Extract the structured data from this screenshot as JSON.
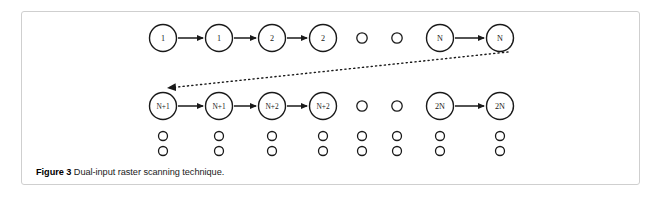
{
  "figure": {
    "caption_label": "Figure 3",
    "caption_text": " Dual-input raster scanning technique.",
    "frame_color": "#cfcfcf",
    "background": "#ffffff",
    "stroke_color": "#1a1a1a"
  },
  "diagram": {
    "type": "flow-diagram",
    "description": "Dual-input raster scanning technique",
    "rows": [
      {
        "id": "row-top",
        "y": 38,
        "node_radius": 13.5,
        "nodes": [
          {
            "label": "1",
            "x": 163,
            "kind": "labeled"
          },
          {
            "label": "1",
            "x": 219,
            "kind": "labeled"
          },
          {
            "label": "2",
            "x": 272,
            "kind": "labeled"
          },
          {
            "label": "2",
            "x": 323,
            "kind": "labeled"
          },
          {
            "label": "",
            "x": 362,
            "kind": "dot"
          },
          {
            "label": "",
            "x": 397,
            "kind": "dot"
          },
          {
            "label": "N",
            "x": 440,
            "kind": "labeled"
          },
          {
            "label": "N",
            "x": 500,
            "kind": "labeled"
          }
        ],
        "arrows": [
          {
            "from_x": 163,
            "to_x": 219
          },
          {
            "from_x": 219,
            "to_x": 272
          },
          {
            "from_x": 272,
            "to_x": 323
          },
          {
            "from_x": 440,
            "to_x": 500
          }
        ]
      },
      {
        "id": "row-second",
        "y": 106,
        "node_radius": 13.5,
        "nodes": [
          {
            "label": "N+1",
            "x": 163,
            "kind": "labeled"
          },
          {
            "label": "N+1",
            "x": 219,
            "kind": "labeled"
          },
          {
            "label": "N+2",
            "x": 272,
            "kind": "labeled"
          },
          {
            "label": "N+2",
            "x": 323,
            "kind": "labeled"
          },
          {
            "label": "",
            "x": 362,
            "kind": "dot"
          },
          {
            "label": "",
            "x": 397,
            "kind": "dot"
          },
          {
            "label": "2N",
            "x": 440,
            "kind": "labeled"
          },
          {
            "label": "2N",
            "x": 500,
            "kind": "labeled"
          }
        ],
        "arrows": [
          {
            "from_x": 163,
            "to_x": 219
          },
          {
            "from_x": 219,
            "to_x": 272
          },
          {
            "from_x": 272,
            "to_x": 323
          },
          {
            "from_x": 440,
            "to_x": 500
          }
        ]
      },
      {
        "id": "row-dots-1",
        "y": 136,
        "node_radius": 4.5,
        "nodes": [
          {
            "label": "",
            "x": 163,
            "kind": "dot"
          },
          {
            "label": "",
            "x": 219,
            "kind": "dot"
          },
          {
            "label": "",
            "x": 272,
            "kind": "dot"
          },
          {
            "label": "",
            "x": 323,
            "kind": "dot"
          },
          {
            "label": "",
            "x": 362,
            "kind": "dot"
          },
          {
            "label": "",
            "x": 397,
            "kind": "dot"
          },
          {
            "label": "",
            "x": 440,
            "kind": "dot"
          },
          {
            "label": "",
            "x": 500,
            "kind": "dot"
          }
        ],
        "arrows": []
      },
      {
        "id": "row-dots-2",
        "y": 151,
        "node_radius": 4.5,
        "nodes": [
          {
            "label": "",
            "x": 163,
            "kind": "dot"
          },
          {
            "label": "",
            "x": 219,
            "kind": "dot"
          },
          {
            "label": "",
            "x": 272,
            "kind": "dot"
          },
          {
            "label": "",
            "x": 323,
            "kind": "dot"
          },
          {
            "label": "",
            "x": 362,
            "kind": "dot"
          },
          {
            "label": "",
            "x": 397,
            "kind": "dot"
          },
          {
            "label": "",
            "x": 440,
            "kind": "dot"
          },
          {
            "label": "",
            "x": 500,
            "kind": "dot"
          }
        ],
        "arrows": []
      }
    ],
    "wrap_arrow": {
      "id": "wrap-around-arrow",
      "style": "dotted",
      "from_x": 508,
      "from_y": 52,
      "to_x": 168,
      "to_y": 88
    }
  }
}
